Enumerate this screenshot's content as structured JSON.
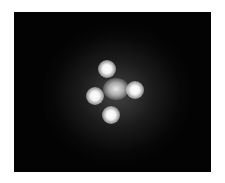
{
  "image": {
    "subject": "gravitational-lens-quad-image",
    "description": "Four bright point sources arranged in a cross around a fainter central glow on a black background",
    "background_color": "#030303",
    "sources": [
      {
        "name": "top",
        "x": 93,
        "y": 57
      },
      {
        "name": "left",
        "x": 81,
        "y": 84
      },
      {
        "name": "right",
        "x": 121,
        "y": 78
      },
      {
        "name": "bottom",
        "x": 97,
        "y": 103
      }
    ],
    "core": {
      "x": 102,
      "y": 77
    }
  }
}
